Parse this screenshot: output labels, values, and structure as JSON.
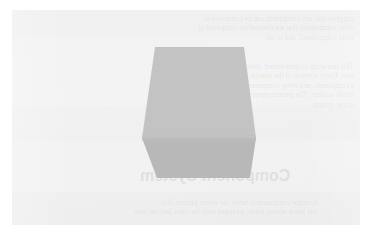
{
  "page": {
    "kind": "faded-scanned-page",
    "background_color": "#ffffff",
    "panel_color": "#ededed",
    "text_color": "#5a5a5a",
    "mirrored": true
  },
  "figure": {
    "name": "isometric-cube",
    "shape": "cube",
    "top_face_color": "#a8a8a8",
    "front_face_color": "#999999",
    "left_face_color": "#9e9e9e",
    "outline_color": "#8f8f8f"
  },
  "heading": {
    "text": "Component System"
  },
  "top_paragraph": {
    "lines": [
      "suggests that any component can be composed of",
      "other components that are themselves composed of",
      "more components, and so on."
    ]
  },
  "middle_paragraph": {
    "lines": [
      "This hierarchy is open-ended: there is no single",
      "root. Every element of the interface is treated as",
      "a component, and every component can be nested",
      "inside another. The pattern repeats at every level",
      "of the system."
    ]
  },
  "bottom_paragraph": {
    "lines": [
      "A single component is never the whole picture. It is",
      "one piece among many, arranged with the rules laid out here."
    ]
  }
}
